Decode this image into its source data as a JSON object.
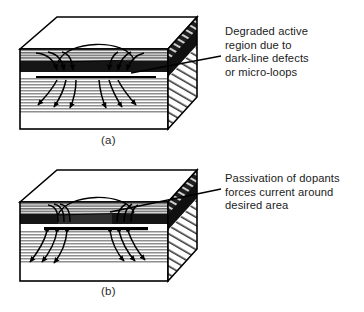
{
  "figure": {
    "title": "",
    "background_color": "#ffffff",
    "ink_color": "#000000",
    "panels": [
      {
        "id": "a",
        "label": "(a)",
        "callout": {
          "name": "degraded-active-region-callout",
          "lines": [
            "Degraded active",
            "region due to",
            "dark-line defects",
            "or micro-loops"
          ]
        }
      },
      {
        "id": "b",
        "label": "(b)",
        "callout": {
          "name": "passivation-of-dopants-callout",
          "lines": [
            "Passivation of dopants",
            "forces current around",
            "desired area"
          ]
        }
      }
    ],
    "colors": {
      "outline": "#000000",
      "hatch_light": "#9a9a9a",
      "hatch_mid": "#7d7d7d",
      "dark_band": "#1a1a1a",
      "white_layer": "#ffffff",
      "side_dark": "#2b2b2b"
    }
  }
}
